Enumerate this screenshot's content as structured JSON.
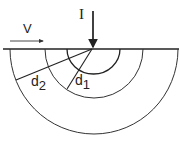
{
  "diagram": {
    "labels": {
      "current": "I",
      "velocity": "V",
      "d1_main": "d",
      "d1_sub": "1",
      "d2_main": "d",
      "d2_sub": "2"
    },
    "colors": {
      "stroke": "#222222",
      "background": "#ffffff"
    },
    "geometry": {
      "surface_y": 49,
      "source_x": 92,
      "arc_radii": [
        26,
        49,
        84
      ]
    }
  }
}
